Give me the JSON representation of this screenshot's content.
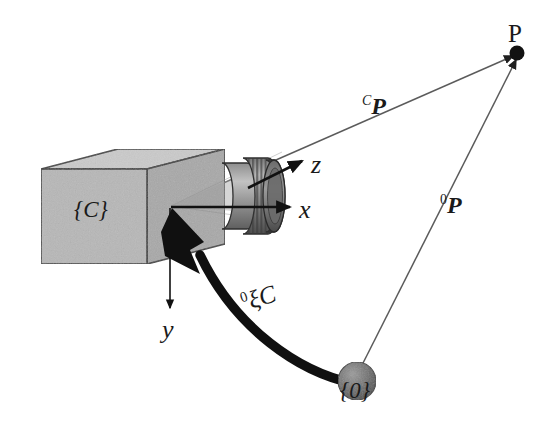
{
  "figure": {
    "type": "camera-projection-diagram",
    "width": 551,
    "height": 444,
    "background": "#ffffff"
  },
  "labels": {
    "camera_frame": "{C}",
    "world_frame": "{0}",
    "axis_x": "x",
    "axis_y": "y",
    "axis_z": "z",
    "point_P": "P",
    "vector_camera_to_point_sup": "C",
    "vector_camera_to_point_base": "P",
    "vector_world_to_point_sup": "0",
    "vector_world_to_point_base": "P",
    "pose_sup": "0",
    "pose_base": "ξC"
  },
  "colors": {
    "ink": "#1a1a1a",
    "thin_line": "#5a5a5a",
    "box_front": "#b6b6b6",
    "box_top": "#c9c9c9",
    "box_side": "#a9a9a9",
    "lens_light": "#b0b0b0",
    "lens_dark": "#6d6d6d",
    "lens_ring": "#8a8a8a",
    "sphere": "#6e6e6e",
    "point_dot": "#141414",
    "outline": "#3a3a3a"
  },
  "geometry": {
    "camera_origin": [
      170,
      207
    ],
    "point_P": [
      517,
      53
    ],
    "world_origin": [
      355,
      382
    ],
    "box_front": {
      "left": 41,
      "right": 147,
      "top": 169,
      "bottom": 264
    },
    "box_depth": [
      77,
      -20
    ],
    "lens": {
      "start_x": 222,
      "end_x": 281,
      "center_y": 196
    },
    "axis_x_end": [
      292,
      207
    ],
    "axis_y_end": [
      170,
      310
    ],
    "axis_z_end": [
      303,
      160
    ]
  }
}
